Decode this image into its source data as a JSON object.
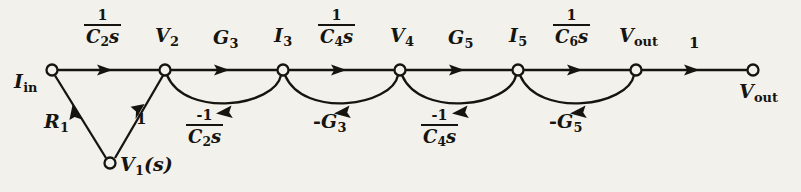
{
  "figure": {
    "type": "signal-flow-graph",
    "background_color": "#f3f1ec",
    "ink_color": "#15140f",
    "width": 801,
    "height": 192,
    "main_line_y": 70,
    "node_radius": 5.5
  },
  "nodes": [
    {
      "id": "Iin",
      "x": 52,
      "y": 70,
      "label_main": "I",
      "label_sub": "in",
      "label_sub_italic": false,
      "label_suffix": "",
      "label_pos": "left"
    },
    {
      "id": "V2",
      "x": 165,
      "y": 70,
      "label_main": "V",
      "label_sub": "2",
      "label_sub_italic": false,
      "label_suffix": "",
      "label_pos": "above"
    },
    {
      "id": "I3",
      "x": 283,
      "y": 70,
      "label_main": "I",
      "label_sub": "3",
      "label_sub_italic": false,
      "label_suffix": "",
      "label_pos": "above"
    },
    {
      "id": "V4",
      "x": 400,
      "y": 70,
      "label_main": "V",
      "label_sub": "4",
      "label_sub_italic": false,
      "label_suffix": "",
      "label_pos": "above"
    },
    {
      "id": "I5",
      "x": 518,
      "y": 70,
      "label_main": "I",
      "label_sub": "5",
      "label_sub_italic": false,
      "label_suffix": "",
      "label_pos": "above"
    },
    {
      "id": "Vout",
      "x": 636,
      "y": 70,
      "label_main": "V",
      "label_sub": "out",
      "label_sub_italic": false,
      "label_suffix": "",
      "label_pos": "above"
    },
    {
      "id": "VoutT",
      "x": 753,
      "y": 70,
      "label_main": "V",
      "label_sub": "out",
      "label_sub_italic": false,
      "label_suffix": "",
      "label_pos": "below-right"
    },
    {
      "id": "V1s",
      "x": 110,
      "y": 163,
      "label_main": "V",
      "label_sub": "1",
      "label_sub_italic": false,
      "label_suffix": "(s)",
      "label_pos": "right"
    }
  ],
  "forward_branches": [
    {
      "from": "Iin",
      "to": "V2",
      "gain_kind": "fraction",
      "numerator": "1",
      "denominator": "C2s",
      "den_main": "C",
      "den_sub": "2",
      "den_tail": "s",
      "label_x": 108,
      "label_y": 12
    },
    {
      "from": "V2",
      "to": "I3",
      "gain_kind": "plain",
      "text": "G3",
      "text_main": "G",
      "text_sub": "3",
      "label_x": 224,
      "label_y": 30
    },
    {
      "from": "I3",
      "to": "V4",
      "gain_kind": "fraction",
      "numerator": "1",
      "denominator": "C4s",
      "den_main": "C",
      "den_sub": "4",
      "den_tail": "s",
      "label_x": 342,
      "label_y": 12
    },
    {
      "from": "V4",
      "to": "I5",
      "gain_kind": "plain",
      "text": "G5",
      "text_main": "G",
      "text_sub": "5",
      "label_x": 459,
      "label_y": 30
    },
    {
      "from": "I5",
      "to": "Vout",
      "gain_kind": "fraction",
      "numerator": "1",
      "denominator": "C6s",
      "den_main": "C",
      "den_sub": "6",
      "den_tail": "s",
      "label_x": 577,
      "label_y": 12
    },
    {
      "from": "Vout",
      "to": "VoutT",
      "gain_kind": "plain",
      "text": "1",
      "text_main": "1",
      "text_sub": "",
      "label_x": 691,
      "label_y": 36
    }
  ],
  "feedback_arcs": [
    {
      "from": "I3",
      "to": "V2",
      "gain_kind": "fraction",
      "numerator": "-1",
      "denominator": "C2s",
      "den_main": "C",
      "den_sub": "2",
      "den_tail": "s",
      "label_x": 203,
      "label_y": 112
    },
    {
      "from": "V4",
      "to": "I3",
      "gain_kind": "plain",
      "text": "-G3",
      "text_main": "G",
      "text_sub": "3",
      "sign": "-",
      "label_x": 315,
      "label_y": 113
    },
    {
      "from": "I5",
      "to": "V4",
      "gain_kind": "fraction",
      "numerator": "-1",
      "denominator": "C4s",
      "den_main": "C",
      "den_sub": "4",
      "den_tail": "s",
      "label_x": 438,
      "label_y": 112
    },
    {
      "from": "Vout",
      "to": "I5",
      "gain_kind": "plain",
      "text": "-G5",
      "text_main": "G",
      "text_sub": "5",
      "sign": "-",
      "label_x": 550,
      "label_y": 113
    }
  ],
  "diagonal_branches": [
    {
      "from": "Iin",
      "to": "V1s",
      "gain_kind": "plain",
      "text": "R1",
      "text_main": "R",
      "text_sub": "1",
      "label_x": 48,
      "label_y": 118
    },
    {
      "from": "V2",
      "to": "V1s",
      "gain_kind": "plain",
      "text": "1",
      "text_main": "1",
      "text_sub": "",
      "label_x": 136,
      "label_y": 116
    }
  ],
  "labels": {
    "Iin": "I_in",
    "V2": "V_2",
    "G3": "G_3",
    "I3": "I_3",
    "V4": "V_4",
    "G5": "G_5",
    "I5": "I_5",
    "Vout": "V_out",
    "V1s": "V_1(s)",
    "R1": "R_1",
    "one": "1",
    "frac_1_C2s": "1/(C_2 s)",
    "frac_1_C4s": "1/(C_4 s)",
    "frac_1_C6s": "1/(C_6 s)",
    "frac_neg1_C2s": "-1/(C_2 s)",
    "frac_neg1_C4s": "-1/(C_4 s)",
    "neg_G3": "-G_3",
    "neg_G5": "-G_5"
  },
  "text": {
    "num_1": "1",
    "num_neg1": "-1",
    "C": "C",
    "s": "s",
    "G": "G",
    "R": "R",
    "V": "V",
    "I": "I",
    "sub_in": "in",
    "sub_out": "out",
    "sub_1": "1",
    "sub_2": "2",
    "sub_3": "3",
    "sub_4": "4",
    "sub_5": "5",
    "sub_6": "6",
    "paren_s": "(s)",
    "minus": "-",
    "one": "1"
  }
}
